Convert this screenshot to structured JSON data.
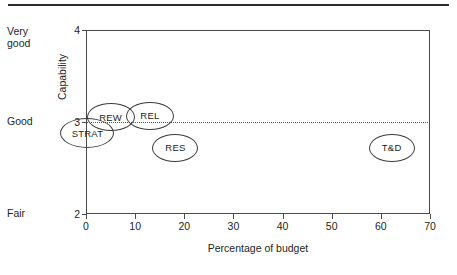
{
  "figure": {
    "has_top_rule": true
  },
  "chart_data": {
    "type": "scatter",
    "title": "",
    "subtitle": "",
    "xlabel": "Percentage of budget",
    "ylabel": "Capability",
    "xlim": [
      0,
      70
    ],
    "ylim": [
      2,
      4
    ],
    "grid": false,
    "legend": "none",
    "x_ticks": [
      "0",
      "10",
      "20",
      "30",
      "40",
      "50",
      "60",
      "70"
    ],
    "x_tick_values": [
      0,
      10,
      20,
      30,
      40,
      50,
      60,
      70
    ],
    "y_ticks": [
      "2",
      "3",
      "4"
    ],
    "y_tick_values": [
      2,
      3,
      4
    ],
    "y_category_labels": [
      {
        "label": "Very\ngood",
        "value": 4
      },
      {
        "label": "Good",
        "value": 3
      },
      {
        "label": "Fair",
        "value": 2
      }
    ],
    "reference_line": {
      "axis": "y",
      "value": 3,
      "style": "dotted"
    },
    "points": [
      {
        "label": "STRAT",
        "x": 0.3,
        "y": 2.88,
        "rx": 27,
        "ry": 15
      },
      {
        "label": "REW",
        "x": 5.0,
        "y": 3.05,
        "rx": 24,
        "ry": 14
      },
      {
        "label": "REL",
        "x": 13.0,
        "y": 3.07,
        "rx": 24,
        "ry": 14
      },
      {
        "label": "RES",
        "x": 18.2,
        "y": 2.72,
        "rx": 23,
        "ry": 14
      },
      {
        "label": "T&D",
        "x": 62.2,
        "y": 2.72,
        "rx": 23,
        "ry": 14
      }
    ]
  }
}
